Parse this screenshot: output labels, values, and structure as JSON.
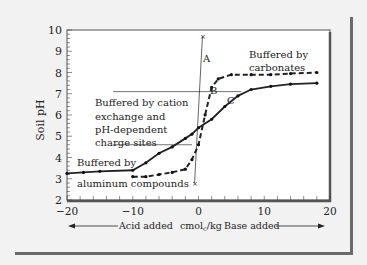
{
  "chart_data": {
    "type": "line",
    "title": "",
    "xlabel": "cmolc/kg",
    "ylabel": "Soil pH",
    "xlim": [
      -20,
      20
    ],
    "ylim": [
      2,
      10
    ],
    "x_ticks": [
      "-20",
      "-10",
      "0",
      "10",
      "20"
    ],
    "y_ticks": [
      "2",
      "3",
      "4",
      "5",
      "6",
      "7",
      "8",
      "9",
      "10"
    ],
    "grid": false,
    "x_direction_labels": {
      "left": "Acid added",
      "right": "Base added"
    },
    "series": [
      {
        "name": "Solid curve (C)",
        "style": "solid",
        "x": [
          -20,
          -17.5,
          -15,
          -10,
          -8,
          -6,
          -4,
          -2,
          -1,
          0,
          2,
          4,
          6,
          8,
          11,
          14,
          18
        ],
        "y": [
          3.25,
          3.3,
          3.35,
          3.4,
          3.75,
          4.2,
          4.5,
          4.9,
          5.1,
          5.4,
          5.8,
          6.4,
          6.9,
          7.2,
          7.35,
          7.45,
          7.5
        ]
      },
      {
        "name": "Dashed curve (B)",
        "style": "dashed",
        "x": [
          -10,
          -8,
          -6,
          -4,
          -2,
          -1,
          0,
          1,
          2,
          3,
          5,
          8,
          11,
          14,
          18
        ],
        "y": [
          3.1,
          3.1,
          3.2,
          3.3,
          3.45,
          3.9,
          4.6,
          6.0,
          7.3,
          7.7,
          7.9,
          7.9,
          7.9,
          7.95,
          8.0
        ]
      },
      {
        "name": "Line A",
        "style": "thin",
        "x": [
          -0.6,
          0.6
        ],
        "y": [
          2.8,
          9.7
        ]
      }
    ],
    "annotations": [
      {
        "text": "A",
        "x": 1.0,
        "y": 9.2
      },
      {
        "text": "B",
        "x": 2.8,
        "y": 8.0
      },
      {
        "text": "C",
        "x": 4.8,
        "y": 6.7
      },
      {
        "text": "Buffered by carbonates",
        "x": 10,
        "y": 8.9
      },
      {
        "text": "Buffered by cation exchange and pH-dependent charge sites",
        "x": -12,
        "y": 6.0
      },
      {
        "text": "Buffered by aluminum compounds",
        "x": -15,
        "y": 3.3
      }
    ],
    "reference_lines": [
      {
        "y": 7.1,
        "x_from": -13,
        "x_to": 6.5
      },
      {
        "y": 4.6,
        "x_from": -13,
        "x_to": -1
      }
    ]
  },
  "labels": {
    "ylabel": "Soil pH",
    "acid": "Acid added",
    "units": "cmol",
    "units_sub": "c",
    "units_tail": "/kg",
    "base": "Base added",
    "A": "A",
    "B": "B",
    "C": "C",
    "carb1": "Buffered by",
    "carb2": "carbonates",
    "cation1": "Buffered by cation",
    "cation2": "exchange and",
    "cation3": "pH-dependent",
    "cation4": "charge sites",
    "al1": "Buffered by",
    "al2": "aluminum compounds"
  }
}
